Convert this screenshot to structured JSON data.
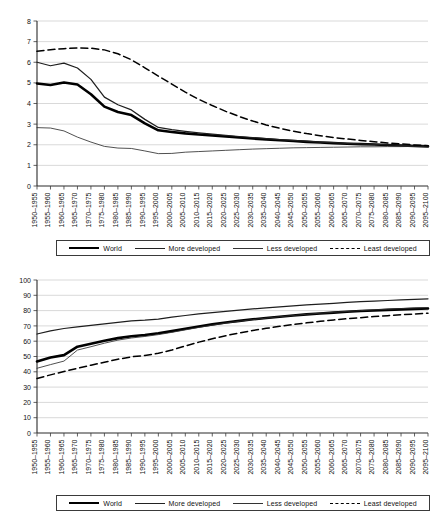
{
  "chart_data": [
    {
      "id": "total-fertility-rate",
      "type": "line",
      "title": "",
      "xlabel": "",
      "ylabel": "",
      "ylim": [
        0,
        8
      ],
      "yticks": [
        0,
        1,
        2,
        3,
        4,
        5,
        6,
        7,
        8
      ],
      "grid": true,
      "legend_position": "bottom",
      "categories": [
        "1950–1955",
        "1955–1960",
        "1960–1965",
        "1965–1970",
        "1970–1975",
        "1975–1980",
        "1980–1985",
        "1985–1990",
        "1990–1995",
        "1995–2000",
        "2000–2005",
        "2005–2010",
        "2010–2015",
        "2015–2020",
        "2020–2025",
        "2025–2030",
        "2030–2035",
        "2035–2040",
        "2040–2045",
        "2045–2050",
        "2050–2055",
        "2055–2060",
        "2060–2065",
        "2065–2070",
        "2070–2075",
        "2075–2080",
        "2080–2085",
        "2085–2090",
        "2090–2095",
        "2095–2100"
      ],
      "series": [
        {
          "name": "World",
          "style": "solid-thick",
          "values": [
            4.97,
            4.9,
            5.02,
            4.92,
            4.45,
            3.85,
            3.59,
            3.44,
            3.04,
            2.7,
            2.62,
            2.55,
            2.5,
            2.45,
            2.4,
            2.35,
            2.3,
            2.26,
            2.22,
            2.18,
            2.14,
            2.11,
            2.08,
            2.05,
            2.03,
            2.01,
            1.99,
            1.96,
            1.94,
            1.92
          ]
        },
        {
          "name": "More developed",
          "style": "solid-thin",
          "values": [
            2.83,
            2.81,
            2.67,
            2.37,
            2.13,
            1.92,
            1.84,
            1.82,
            1.7,
            1.57,
            1.58,
            1.64,
            1.67,
            1.7,
            1.73,
            1.76,
            1.79,
            1.81,
            1.83,
            1.85,
            1.86,
            1.87,
            1.88,
            1.89,
            1.9,
            1.9,
            1.91,
            1.91,
            1.92,
            1.92
          ]
        },
        {
          "name": "Less developed",
          "style": "solid-med",
          "values": [
            6.0,
            5.83,
            5.96,
            5.72,
            5.17,
            4.31,
            3.94,
            3.69,
            3.23,
            2.84,
            2.73,
            2.65,
            2.58,
            2.52,
            2.46,
            2.4,
            2.35,
            2.3,
            2.25,
            2.21,
            2.17,
            2.13,
            2.1,
            2.07,
            2.04,
            2.02,
            1.99,
            1.97,
            1.95,
            1.93
          ]
        },
        {
          "name": "Least developed",
          "style": "dashed",
          "values": [
            6.53,
            6.61,
            6.66,
            6.69,
            6.68,
            6.6,
            6.41,
            6.12,
            5.73,
            5.33,
            4.94,
            4.55,
            4.2,
            3.9,
            3.62,
            3.37,
            3.15,
            2.96,
            2.8,
            2.66,
            2.54,
            2.44,
            2.35,
            2.28,
            2.21,
            2.15,
            2.09,
            2.04,
            1.99,
            1.95
          ]
        }
      ]
    },
    {
      "id": "life-expectancy-at-birth",
      "type": "line",
      "title": "",
      "xlabel": "",
      "ylabel": "",
      "ylim": [
        0,
        100
      ],
      "yticks": [
        0,
        10,
        20,
        30,
        40,
        50,
        60,
        70,
        80,
        90,
        100
      ],
      "grid": true,
      "legend_position": "bottom",
      "categories": [
        "1950–1955",
        "1955–1960",
        "1960–1965",
        "1965–1970",
        "1970–1975",
        "1975–1980",
        "1980–1985",
        "1985–1990",
        "1990–1995",
        "1995–2000",
        "2000–2005",
        "2005–2010",
        "2010–2015",
        "2015–2020",
        "2020–2025",
        "2025–2030",
        "2030–2035",
        "2035–2040",
        "2040–2045",
        "2045–2050",
        "2050–2055",
        "2055–2060",
        "2060–2065",
        "2065–2070",
        "2070–2075",
        "2075–2080",
        "2080–2085",
        "2085–2090",
        "2090–2095",
        "2095–2100"
      ],
      "series": [
        {
          "name": "World",
          "style": "solid-thick",
          "values": [
            46.8,
            49.4,
            50.9,
            56.4,
            58.3,
            60.3,
            62.0,
            63.2,
            64.1,
            65.2,
            66.6,
            68.1,
            69.6,
            71.0,
            72.2,
            73.3,
            74.3,
            75.2,
            76.0,
            76.8,
            77.5,
            78.1,
            78.7,
            79.2,
            79.7,
            80.1,
            80.5,
            80.8,
            81.1,
            81.4
          ]
        },
        {
          "name": "More developed",
          "style": "solid-med",
          "values": [
            64.7,
            66.8,
            68.3,
            69.4,
            70.4,
            71.3,
            72.3,
            73.3,
            73.8,
            74.5,
            75.7,
            76.8,
            77.8,
            78.7,
            79.5,
            80.3,
            81.1,
            81.8,
            82.5,
            83.1,
            83.7,
            84.3,
            84.8,
            85.3,
            85.8,
            86.2,
            86.6,
            87.0,
            87.4,
            87.7
          ]
        },
        {
          "name": "Less developed",
          "style": "solid-thin",
          "values": [
            42.3,
            44.7,
            47.0,
            54.2,
            56.4,
            58.7,
            60.7,
            62.1,
            63.1,
            64.3,
            65.8,
            67.4,
            69.0,
            70.5,
            71.8,
            73.0,
            74.1,
            75.1,
            76.0,
            76.8,
            77.6,
            78.3,
            78.9,
            79.5,
            80.0,
            80.5,
            80.9,
            81.3,
            81.7,
            82.0
          ]
        },
        {
          "name": "Least developed",
          "style": "dashed",
          "values": [
            35.6,
            38.0,
            40.2,
            42.3,
            44.3,
            46.3,
            48.2,
            49.8,
            50.7,
            52.1,
            54.2,
            56.9,
            59.4,
            61.6,
            63.6,
            65.4,
            67.0,
            68.4,
            69.7,
            70.9,
            72.0,
            73.0,
            73.9,
            74.7,
            75.4,
            76.1,
            76.7,
            77.3,
            77.8,
            78.3
          ]
        }
      ]
    }
  ],
  "legend": {
    "entries": [
      {
        "label": "World",
        "style": "solid-thick"
      },
      {
        "label": "More developed",
        "style": "solid-med"
      },
      {
        "label": "Less developed",
        "style": "solid-thin"
      },
      {
        "label": "Least developed",
        "style": "dashed"
      }
    ]
  }
}
